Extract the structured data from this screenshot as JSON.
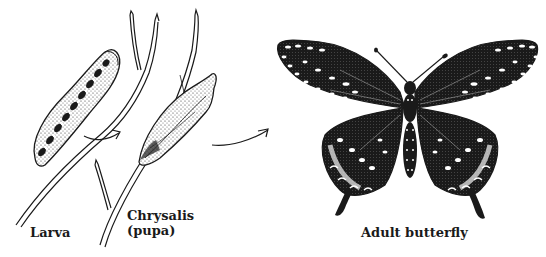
{
  "diagram": {
    "title_visible": false,
    "stages": [
      {
        "id": "larva",
        "label": "Larva",
        "icon": "caterpillar-illustration"
      },
      {
        "id": "chrysalis",
        "label_line1": "Chrysalis",
        "label_line2": "(pupa)",
        "icon": "chrysalis-illustration"
      },
      {
        "id": "adult",
        "label": "Adult butterfly",
        "icon": "butterfly-illustration"
      }
    ],
    "connectors": [
      {
        "from": "larva",
        "to": "chrysalis",
        "icon": "arrow-right-icon"
      },
      {
        "from": "chrysalis",
        "to": "adult",
        "icon": "arrow-right-icon"
      }
    ],
    "colors": {
      "ink": "#1a1a1a",
      "paper": "#ffffff",
      "shade": "#555555"
    }
  }
}
